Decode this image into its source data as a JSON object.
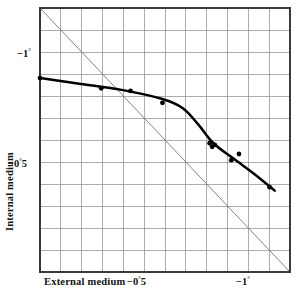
{
  "figure": {
    "background": "#ffffff",
    "frame_color": "#3a3a3a",
    "grid_color": "#8a8a8a",
    "curve_color": "#000000",
    "identity_line_color": "#777777",
    "marker_color": "#000000"
  },
  "axes": {
    "x_title": "External medium",
    "y_title": "Internal medium",
    "x_ticks": [
      {
        "label_number": "−0",
        "label_deg": "°",
        "label_frac": "5",
        "value": -0.5
      },
      {
        "label_number": "−1",
        "label_deg": "°",
        "label_frac": "",
        "value": -1.0
      }
    ],
    "y_ticks": [
      {
        "label_number": "−0",
        "label_deg": "°",
        "label_frac": "5",
        "value": -0.5
      },
      {
        "label_number": "−1",
        "label_deg": "°",
        "label_frac": "",
        "value": -1.0
      }
    ]
  },
  "chart_data": {
    "type": "scatter",
    "title": "",
    "subtitle": "",
    "xlabel": "External medium",
    "ylabel": "Internal medium",
    "xlim": [
      -0.24,
      -1.22
    ],
    "ylim": [
      -0.24,
      -1.22
    ],
    "x_tick_values": [
      -0.5,
      -1.0
    ],
    "y_tick_values": [
      -0.5,
      -1.0
    ],
    "x_tick_labels": [
      "−0°5",
      "−1°"
    ],
    "y_tick_labels": [
      "−0°5",
      "−1°"
    ],
    "grid": true,
    "grid_columns": 12,
    "grid_rows": 12,
    "legend": "none",
    "series": [
      {
        "name": "Observed points",
        "type": "scatter",
        "marker": "filled-circle",
        "points": [
          {
            "x": -0.24,
            "y": -0.5
          },
          {
            "x": -0.48,
            "y": -0.538
          },
          {
            "x": -0.595,
            "y": -0.548
          },
          {
            "x": -0.72,
            "y": -0.592
          },
          {
            "x": -0.905,
            "y": -0.742
          },
          {
            "x": -0.915,
            "y": -0.755
          },
          {
            "x": -0.925,
            "y": -0.748
          },
          {
            "x": -0.99,
            "y": -0.805
          },
          {
            "x": -1.02,
            "y": -0.782
          },
          {
            "x": -1.14,
            "y": -0.905
          }
        ]
      },
      {
        "name": "Fitted curve",
        "type": "line",
        "points": [
          {
            "x": -0.24,
            "y": -0.5
          },
          {
            "x": -0.4,
            "y": -0.522
          },
          {
            "x": -0.56,
            "y": -0.544
          },
          {
            "x": -0.72,
            "y": -0.578
          },
          {
            "x": -0.8,
            "y": -0.612
          },
          {
            "x": -0.86,
            "y": -0.672
          },
          {
            "x": -0.92,
            "y": -0.742
          },
          {
            "x": -1.0,
            "y": -0.8
          },
          {
            "x": -1.08,
            "y": -0.856
          },
          {
            "x": -1.16,
            "y": -0.918
          }
        ]
      },
      {
        "name": "Identity line (y = x)",
        "type": "line",
        "style": "thin-grey",
        "points": [
          {
            "x": -0.24,
            "y": -0.24
          },
          {
            "x": -1.22,
            "y": -1.22
          }
        ]
      }
    ],
    "annotations": []
  }
}
